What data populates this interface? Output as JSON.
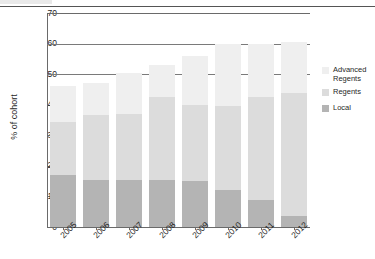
{
  "chart_data": {
    "type": "bar",
    "subtype": "stacked-bar",
    "title": "",
    "xlabel": "",
    "ylabel": "% of cohort",
    "ylim": [
      0,
      70
    ],
    "yticks": [
      0,
      10,
      20,
      30,
      40,
      50,
      60,
      70
    ],
    "grid": true,
    "gridlines_at": [
      50,
      60,
      70
    ],
    "legend_position": "right",
    "categories": [
      "2005",
      "2006",
      "2007",
      "2008",
      "2009",
      "2010",
      "2011",
      "2012"
    ],
    "series": [
      {
        "name": "Local",
        "color": "#b4b4b4",
        "values": [
          17.0,
          15.5,
          15.5,
          15.5,
          15.0,
          12.0,
          9.0,
          3.5
        ]
      },
      {
        "name": "Regents",
        "color": "#dcdcdc",
        "values": [
          17.5,
          21.0,
          21.5,
          27.0,
          25.0,
          27.5,
          33.5,
          40.5
        ]
      },
      {
        "name": "Advanced Regents",
        "color": "#efefef",
        "values": [
          11.5,
          10.5,
          13.5,
          10.5,
          16.0,
          20.5,
          17.5,
          16.5
        ]
      }
    ],
    "totals": [
      46.0,
      47.0,
      50.5,
      53.0,
      56.0,
      60.0,
      60.0,
      60.5
    ]
  },
  "axis": {
    "y_title": "% of cohort",
    "y_tick_labels": [
      "0",
      "10",
      "20",
      "30",
      "40",
      "50",
      "60",
      "70"
    ],
    "x_tick_labels": [
      "2005",
      "2006",
      "2007",
      "2008",
      "2009",
      "2010",
      "2011",
      "2012"
    ]
  },
  "legend": {
    "items": [
      {
        "label": "Advanced Regents",
        "swatch_name": "legend-swatch-advanced-regents",
        "color": "#efefef"
      },
      {
        "label": "Regents",
        "swatch_name": "legend-swatch-regents",
        "color": "#dcdcdc"
      },
      {
        "label": "Local",
        "swatch_name": "legend-swatch-local",
        "color": "#b4b4b4"
      }
    ]
  }
}
